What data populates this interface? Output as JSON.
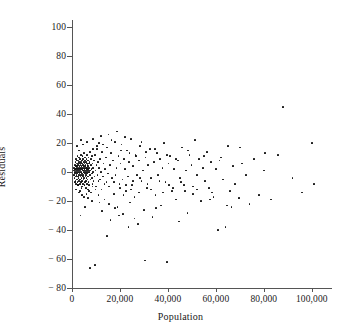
{
  "chart_data": {
    "type": "scatter",
    "title": "",
    "xlabel": "Population",
    "ylabel": "Residuals",
    "xlim": [
      0,
      108000
    ],
    "ylim": [
      -80,
      105
    ],
    "grid": false,
    "legend": null,
    "xticks": [
      0,
      20000,
      40000,
      60000,
      80000,
      100000
    ],
    "xticklabels": [
      "0",
      "20,000",
      "40,000",
      "60,000",
      "80,000",
      "100,000"
    ],
    "yticks": [
      100,
      80,
      60,
      40,
      20,
      0,
      -20,
      -40,
      -60,
      -80
    ],
    "yticklabels": [
      "100",
      "80",
      "60",
      "40",
      "20",
      "0",
      "− 20",
      "− 40",
      "− 60",
      "− 80"
    ],
    "marker": {
      "shape": "circle",
      "size": 1.7,
      "color": "#0d0d0d"
    },
    "point_count": 312,
    "points": [
      [
        700,
        1
      ],
      [
        800,
        -2
      ],
      [
        900,
        3
      ],
      [
        1000,
        0
      ],
      [
        1100,
        -4
      ],
      [
        1200,
        5
      ],
      [
        1250,
        2
      ],
      [
        1300,
        -1
      ],
      [
        1400,
        7
      ],
      [
        1450,
        -6
      ],
      [
        1500,
        1
      ],
      [
        1550,
        4
      ],
      [
        1600,
        -3
      ],
      [
        1650,
        9
      ],
      [
        1700,
        0
      ],
      [
        1750,
        -8
      ],
      [
        1800,
        2
      ],
      [
        1850,
        6
      ],
      [
        1900,
        -2
      ],
      [
        1950,
        3
      ],
      [
        2000,
        -5
      ],
      [
        2050,
        8
      ],
      [
        2100,
        1
      ],
      [
        2150,
        -1
      ],
      [
        2200,
        4
      ],
      [
        2250,
        -7
      ],
      [
        2300,
        11
      ],
      [
        2350,
        2
      ],
      [
        2400,
        -3
      ],
      [
        2450,
        6
      ],
      [
        2500,
        0
      ],
      [
        2550,
        -9
      ],
      [
        2600,
        5
      ],
      [
        2650,
        3
      ],
      [
        2700,
        -4
      ],
      [
        2750,
        8
      ],
      [
        2800,
        1
      ],
      [
        2850,
        -2
      ],
      [
        2900,
        7
      ],
      [
        2950,
        -6
      ],
      [
        3000,
        2
      ],
      [
        3050,
        10
      ],
      [
        3100,
        -1
      ],
      [
        3150,
        4
      ],
      [
        3200,
        -5
      ],
      [
        3250,
        6
      ],
      [
        3300,
        0
      ],
      [
        3350,
        -8
      ],
      [
        3400,
        3
      ],
      [
        3450,
        9
      ],
      [
        3500,
        -3
      ],
      [
        3550,
        5
      ],
      [
        3600,
        1
      ],
      [
        3650,
        -7
      ],
      [
        3700,
        12
      ],
      [
        3750,
        2
      ],
      [
        3800,
        -2
      ],
      [
        3850,
        7
      ],
      [
        3900,
        -4
      ],
      [
        3950,
        4
      ],
      [
        4000,
        0
      ],
      [
        4050,
        -10
      ],
      [
        4100,
        6
      ],
      [
        4150,
        3
      ],
      [
        4200,
        -1
      ],
      [
        4250,
        8
      ],
      [
        4300,
        -6
      ],
      [
        4350,
        2
      ],
      [
        4400,
        11
      ],
      [
        4450,
        -3
      ],
      [
        4500,
        5
      ],
      [
        4550,
        1
      ],
      [
        4600,
        -8
      ],
      [
        4650,
        9
      ],
      [
        4700,
        -2
      ],
      [
        4750,
        4
      ],
      [
        4800,
        0
      ],
      [
        4850,
        -5
      ],
      [
        4900,
        7
      ],
      [
        4950,
        3
      ],
      [
        5000,
        -4
      ],
      [
        5050,
        13
      ],
      [
        5100,
        1
      ],
      [
        5150,
        -9
      ],
      [
        5200,
        6
      ],
      [
        5250,
        2
      ],
      [
        5300,
        -1
      ],
      [
        5350,
        8
      ],
      [
        5400,
        -7
      ],
      [
        5450,
        4
      ],
      [
        5500,
        10
      ],
      [
        5550,
        0
      ],
      [
        5600,
        -3
      ],
      [
        5650,
        5
      ],
      [
        5700,
        -11
      ],
      [
        5750,
        3
      ],
      [
        5800,
        7
      ],
      [
        5850,
        -2
      ],
      [
        5900,
        1
      ],
      [
        5950,
        -6
      ],
      [
        6000,
        9
      ],
      [
        6050,
        2
      ],
      [
        6100,
        -4
      ],
      [
        6150,
        6
      ],
      [
        6200,
        0
      ],
      [
        6250,
        -8
      ],
      [
        6300,
        12
      ],
      [
        6350,
        3
      ],
      [
        6400,
        -1
      ],
      [
        6450,
        5
      ],
      [
        6500,
        -5
      ],
      [
        6550,
        8
      ],
      [
        6600,
        2
      ],
      [
        6650,
        -12
      ],
      [
        6700,
        4
      ],
      [
        6750,
        1
      ],
      [
        6800,
        -3
      ],
      [
        6850,
        10
      ],
      [
        6900,
        -7
      ],
      [
        6950,
        6
      ],
      [
        7000,
        0
      ],
      [
        7100,
        3
      ],
      [
        7200,
        -9
      ],
      [
        7300,
        7
      ],
      [
        7400,
        -2
      ],
      [
        7500,
        14
      ],
      [
        7600,
        1
      ],
      [
        7700,
        -5
      ],
      [
        7800,
        5
      ],
      [
        7900,
        -14
      ],
      [
        8000,
        9
      ],
      [
        8100,
        2
      ],
      [
        8200,
        -4
      ],
      [
        8300,
        11
      ],
      [
        8400,
        -1
      ],
      [
        8500,
        6
      ],
      [
        8600,
        -8
      ],
      [
        8700,
        3
      ],
      [
        8800,
        16
      ],
      [
        8900,
        0
      ],
      [
        9000,
        -6
      ],
      [
        9200,
        8
      ],
      [
        9400,
        -3
      ],
      [
        9600,
        12
      ],
      [
        9800,
        1
      ],
      [
        10000,
        -10
      ],
      [
        10200,
        5
      ],
      [
        10400,
        18
      ],
      [
        10600,
        -2
      ],
      [
        10800,
        7
      ],
      [
        11000,
        -16
      ],
      [
        11200,
        3
      ],
      [
        11400,
        20
      ],
      [
        11600,
        -5
      ],
      [
        11800,
        9
      ],
      [
        12000,
        0
      ],
      [
        12300,
        -12
      ],
      [
        12600,
        14
      ],
      [
        12900,
        -3
      ],
      [
        13200,
        6
      ],
      [
        13500,
        -19
      ],
      [
        13800,
        2
      ],
      [
        14100,
        10
      ],
      [
        14400,
        -7
      ],
      [
        14700,
        17
      ],
      [
        15000,
        -1
      ],
      [
        15400,
        -22
      ],
      [
        15800,
        5
      ],
      [
        16200,
        13
      ],
      [
        16600,
        -4
      ],
      [
        17000,
        8
      ],
      [
        17400,
        -15
      ],
      [
        17800,
        21
      ],
      [
        18200,
        -2
      ],
      [
        18600,
        3
      ],
      [
        19000,
        -24
      ],
      [
        19400,
        11
      ],
      [
        19800,
        -8
      ],
      [
        20200,
        6
      ],
      [
        20600,
        19
      ],
      [
        21000,
        -5
      ],
      [
        21400,
        -29
      ],
      [
        21800,
        9
      ],
      [
        22200,
        2
      ],
      [
        22600,
        -13
      ],
      [
        23000,
        15
      ],
      [
        23400,
        -3
      ],
      [
        23800,
        7
      ],
      [
        24200,
        -21
      ],
      [
        24600,
        23
      ],
      [
        25000,
        -9
      ],
      [
        25500,
        4
      ],
      [
        26000,
        -17
      ],
      [
        26500,
        12
      ],
      [
        27000,
        -2
      ],
      [
        27500,
        -36
      ],
      [
        28000,
        8
      ],
      [
        28500,
        18
      ],
      [
        29000,
        -6
      ],
      [
        29500,
        1
      ],
      [
        30000,
        -26
      ],
      [
        30600,
        10
      ],
      [
        31200,
        -11
      ],
      [
        31800,
        5
      ],
      [
        32400,
        16
      ],
      [
        33000,
        -4
      ],
      [
        33600,
        -31
      ],
      [
        34200,
        7
      ],
      [
        34800,
        -16
      ],
      [
        35400,
        13
      ],
      [
        36000,
        -2
      ],
      [
        36600,
        9
      ],
      [
        37200,
        -23
      ],
      [
        37800,
        3
      ],
      [
        38400,
        20
      ],
      [
        39000,
        -7
      ],
      [
        39600,
        -62
      ],
      [
        40200,
        6
      ],
      [
        41000,
        11
      ],
      [
        41800,
        -13
      ],
      [
        42600,
        2
      ],
      [
        43400,
        -19
      ],
      [
        44200,
        8
      ],
      [
        45000,
        -4
      ],
      [
        45800,
        17
      ],
      [
        46600,
        -9
      ],
      [
        47400,
        1
      ],
      [
        48200,
        -28
      ],
      [
        49000,
        12
      ],
      [
        49800,
        5
      ],
      [
        50600,
        -15
      ],
      [
        51400,
        22
      ],
      [
        52200,
        -2
      ],
      [
        53000,
        9
      ],
      [
        53800,
        -20
      ],
      [
        54600,
        3
      ],
      [
        55400,
        -6
      ],
      [
        56200,
        14
      ],
      [
        57000,
        -11
      ],
      [
        58000,
        7
      ],
      [
        59000,
        -17
      ],
      [
        60000,
        2
      ],
      [
        61000,
        -40
      ],
      [
        62000,
        10
      ],
      [
        63000,
        -5
      ],
      [
        64000,
        -38
      ],
      [
        65000,
        18
      ],
      [
        66000,
        -13
      ],
      [
        67000,
        4
      ],
      [
        68000,
        -8
      ],
      [
        69500,
        -18
      ],
      [
        71000,
        6
      ],
      [
        72500,
        -2
      ],
      [
        74000,
        -22
      ],
      [
        76000,
        9
      ],
      [
        78000,
        -16
      ],
      [
        80000,
        1
      ],
      [
        83000,
        -19
      ],
      [
        86000,
        12
      ],
      [
        88000,
        45
      ],
      [
        92000,
        -4
      ],
      [
        96000,
        -14
      ],
      [
        100000,
        20
      ],
      [
        101000,
        -8
      ],
      [
        30500,
        -61
      ],
      [
        44500,
        -34
      ],
      [
        23500,
        -38
      ],
      [
        14500,
        -44
      ],
      [
        7500,
        -66
      ],
      [
        9500,
        -64
      ],
      [
        3500,
        -30
      ],
      [
        5500,
        -24
      ],
      [
        16000,
        -33
      ],
      [
        12500,
        -27
      ],
      [
        19500,
        -30
      ],
      [
        26000,
        -32
      ],
      [
        35000,
        -25
      ],
      [
        8200,
        -20
      ],
      [
        6800,
        -18
      ],
      [
        4200,
        -16
      ],
      [
        2800,
        -14
      ],
      [
        11500,
        -21
      ],
      [
        18000,
        -25
      ],
      [
        21500,
        -16
      ],
      [
        24500,
        -12
      ],
      [
        27800,
        -14
      ],
      [
        33000,
        -12
      ],
      [
        38000,
        -14
      ],
      [
        42000,
        -11
      ],
      [
        47000,
        -13
      ],
      [
        52000,
        -12
      ],
      [
        58500,
        -14
      ],
      [
        64500,
        -23
      ],
      [
        66500,
        -24
      ],
      [
        57500,
        -19
      ],
      [
        50500,
        -10
      ],
      [
        45500,
        -7
      ],
      [
        40500,
        -9
      ],
      [
        36500,
        -6
      ],
      [
        31500,
        -8
      ],
      [
        28500,
        -4
      ],
      [
        25500,
        -6
      ],
      [
        22500,
        -9
      ],
      [
        20000,
        -11
      ],
      [
        17500,
        -7
      ],
      [
        15500,
        -10
      ],
      [
        13500,
        -8
      ],
      [
        11000,
        -6
      ],
      [
        9800,
        -12
      ],
      [
        8600,
        -10
      ],
      [
        7200,
        -13
      ],
      [
        6000,
        -15
      ],
      [
        5000,
        -17
      ],
      [
        4000,
        -11
      ],
      [
        3200,
        -13
      ],
      [
        2400,
        -9
      ],
      [
        1800,
        -12
      ],
      [
        1200,
        -7
      ],
      [
        10500,
        16
      ],
      [
        13000,
        19
      ],
      [
        16500,
        22
      ],
      [
        20500,
        15
      ],
      [
        24000,
        13
      ],
      [
        29000,
        21
      ],
      [
        34500,
        16
      ],
      [
        39500,
        12
      ],
      [
        43500,
        9
      ],
      [
        48500,
        15
      ],
      [
        55000,
        11
      ],
      [
        61500,
        8
      ],
      [
        70000,
        17
      ],
      [
        80500,
        13
      ],
      [
        18800,
        28
      ],
      [
        12200,
        25
      ],
      [
        8800,
        23
      ],
      [
        15200,
        26
      ],
      [
        22000,
        24
      ],
      [
        6400,
        21
      ],
      [
        4600,
        19
      ],
      [
        3800,
        22
      ],
      [
        26800,
        11
      ],
      [
        31000,
        14
      ],
      [
        3000,
        15
      ],
      [
        2200,
        18
      ]
    ]
  }
}
